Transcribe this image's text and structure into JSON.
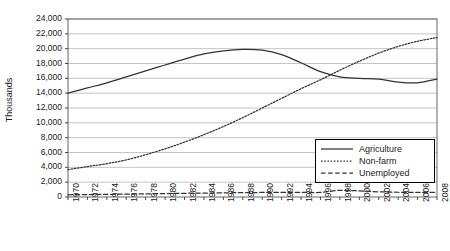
{
  "chart_data": {
    "type": "line",
    "title": "",
    "xlabel": "",
    "ylabel": "Thousands",
    "xlim": [
      1970,
      2008
    ],
    "ylim": [
      0,
      24000
    ],
    "ytick_step": 2000,
    "grid": true,
    "legend_position": "right-middle",
    "ytick_labels": [
      "24,000",
      "22,000",
      "20,000",
      "18,000",
      "16,000",
      "14,000",
      "12,000",
      "10,000",
      "8,000",
      "6,000",
      "4,000",
      "2,000",
      "0"
    ],
    "ytick_values": [
      24000,
      22000,
      20000,
      18000,
      16000,
      14000,
      12000,
      10000,
      8000,
      6000,
      4000,
      2000,
      0
    ],
    "categories": [
      "1970",
      "1972",
      "1974",
      "1976",
      "1978",
      "1980",
      "1982",
      "1984",
      "1986",
      "1988",
      "1990",
      "1992",
      "1994",
      "1996",
      "1998",
      "2000",
      "2002",
      "2004",
      "2006",
      "2008"
    ],
    "x": [
      1970,
      1972,
      1974,
      1976,
      1978,
      1980,
      1982,
      1984,
      1986,
      1988,
      1990,
      1992,
      1994,
      1996,
      1998,
      2000,
      2002,
      2004,
      2006,
      2008
    ],
    "series": [
      {
        "name": "Agriculture",
        "style": "solid",
        "color": "#333333",
        "values": [
          14000,
          14700,
          15400,
          16200,
          17000,
          17800,
          18600,
          19300,
          19700,
          19900,
          19800,
          19200,
          18100,
          16900,
          16200,
          16000,
          15900,
          15500,
          15400,
          15900
        ]
      },
      {
        "name": "Non-farm",
        "style": "dotted",
        "color": "#333333",
        "values": [
          3700,
          4100,
          4500,
          5000,
          5700,
          6500,
          7400,
          8400,
          9500,
          10700,
          12000,
          13300,
          14600,
          15800,
          17100,
          18300,
          19400,
          20300,
          21000,
          21500
        ]
      },
      {
        "name": "Unemployed",
        "style": "dashed",
        "color": "#333333",
        "values": [
          300,
          330,
          360,
          390,
          420,
          460,
          500,
          530,
          560,
          590,
          610,
          620,
          630,
          620,
          900,
          820,
          700,
          640,
          620,
          640
        ]
      }
    ],
    "legend": [
      {
        "label": "Agriculture",
        "style": "solid"
      },
      {
        "label": "Non-farm",
        "style": "dotted"
      },
      {
        "label": "Unemployed",
        "style": "dashed"
      }
    ]
  }
}
